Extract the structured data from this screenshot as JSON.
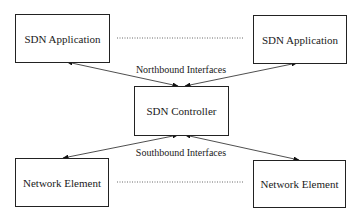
{
  "diagram": {
    "nodes": {
      "app_left": "SDN Application",
      "app_right": "SDN Application",
      "controller": "SDN Controller",
      "ne_left": "Network Element",
      "ne_right": "Network Element"
    },
    "labels": {
      "northbound": "Northbound Interfaces",
      "southbound": "Southbound Interfaces"
    },
    "edges": [
      {
        "from": "app_left",
        "to": "controller",
        "type": "bidirectional-arrow"
      },
      {
        "from": "app_right",
        "to": "controller",
        "type": "bidirectional-arrow"
      },
      {
        "from": "controller",
        "to": "ne_left",
        "type": "bidirectional-arrow"
      },
      {
        "from": "controller",
        "to": "ne_right",
        "type": "bidirectional-arrow"
      },
      {
        "from": "app_left",
        "to": "app_right",
        "type": "dotted-line"
      },
      {
        "from": "ne_left",
        "to": "ne_right",
        "type": "dotted-line"
      }
    ]
  }
}
